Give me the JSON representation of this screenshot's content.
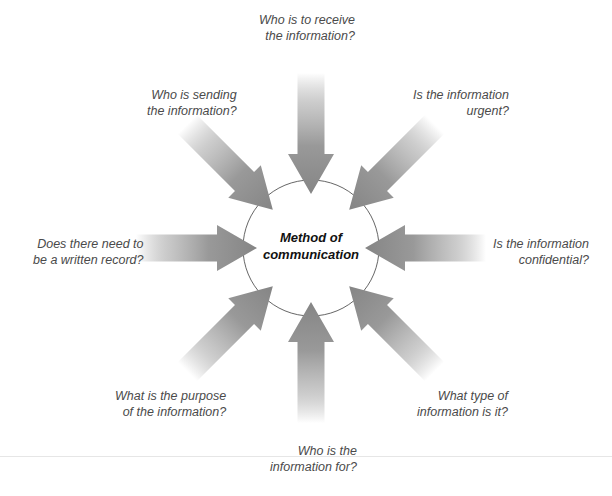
{
  "diagram": {
    "type": "radial-influence-diagram",
    "center": {
      "label_line1": "Method of",
      "label_line2": "communication"
    },
    "arrow_color": "#8a8a8a",
    "questions": [
      {
        "id": "top",
        "line1": "Who is to receive",
        "line2": "the information?",
        "angle": 90
      },
      {
        "id": "top-right",
        "line1": "Is the information",
        "line2": "urgent?",
        "angle": 135
      },
      {
        "id": "right",
        "line1": "Is the information",
        "line2": "confidential?",
        "angle": 180
      },
      {
        "id": "bottom-right",
        "line1": "What type of",
        "line2": "information is it?",
        "angle": 225
      },
      {
        "id": "bottom",
        "line1": "Who is the",
        "line2": "information for?",
        "angle": 270
      },
      {
        "id": "bottom-left",
        "line1": "What is the purpose",
        "line2": "of the information?",
        "angle": 315
      },
      {
        "id": "left",
        "line1": "Does there need to",
        "line2": "be a written record?",
        "angle": 0
      },
      {
        "id": "top-left",
        "line1": "Who is sending",
        "line2": "the information?",
        "angle": 45
      }
    ]
  }
}
